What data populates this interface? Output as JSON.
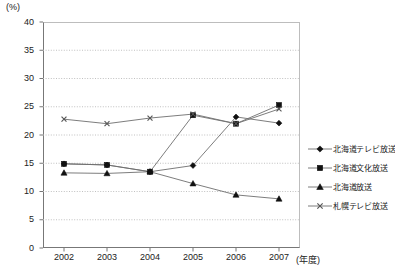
{
  "chart_data": {
    "type": "line",
    "title": "",
    "xlabel": "年度",
    "ylabel": "(%)",
    "y_unit_label": "(%)",
    "x_unit_label": "(年度)",
    "categories": [
      "2002",
      "2003",
      "2004",
      "2005",
      "2006",
      "2007"
    ],
    "x": [
      2002,
      2003,
      2004,
      2005,
      2006,
      2007
    ],
    "ylim": [
      0,
      40
    ],
    "ytick_labels": [
      "0",
      "5",
      "10",
      "15",
      "20",
      "25",
      "30",
      "35",
      "40"
    ],
    "yticks": [
      0,
      5,
      10,
      15,
      20,
      25,
      30,
      35,
      40
    ],
    "grid": true,
    "grid_style": "dotted-horizontal",
    "legend_position": "right",
    "series": [
      {
        "name": "北海道テレビ放送",
        "marker": "diamond",
        "values": [
          14.9,
          14.7,
          13.5,
          14.6,
          23.2,
          22.1
        ]
      },
      {
        "name": "北海道文化放送",
        "marker": "square",
        "values": [
          14.9,
          14.7,
          13.5,
          23.5,
          22.0,
          25.3
        ]
      },
      {
        "name": "北海道放送",
        "marker": "triangle",
        "values": [
          13.3,
          13.2,
          13.5,
          11.4,
          9.4,
          8.7
        ]
      },
      {
        "name": "札幌テレビ放送",
        "marker": "cross",
        "values": [
          22.8,
          22.0,
          23.0,
          23.7,
          22.0,
          24.6
        ]
      }
    ]
  },
  "legend": {
    "items": [
      {
        "label": "北海道テレビ放送",
        "marker": "diamond"
      },
      {
        "label": "北海道文化放送",
        "marker": "square"
      },
      {
        "label": "北海道放送",
        "marker": "triangle"
      },
      {
        "label": "札幌テレビ放送",
        "marker": "cross"
      }
    ]
  },
  "colors": {
    "line": "#6e6e6e",
    "marker": "#111111",
    "axis": "#777777",
    "grid": "#b9b9b9",
    "text": "#1a1a1a"
  },
  "caption": {
    "text": ""
  }
}
